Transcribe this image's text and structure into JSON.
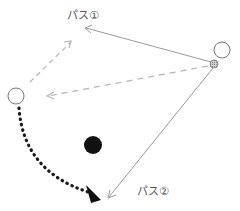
{
  "diagram": {
    "title": "",
    "labels": {
      "pass1": "パス①",
      "pass2": "パス②"
    },
    "nodes": [
      {
        "id": "player-right",
        "type": "open-circle",
        "cx": 222,
        "cy": 50,
        "r": 8
      },
      {
        "id": "ball",
        "type": "shaded-circle",
        "cx": 214,
        "cy": 64,
        "r": 4
      },
      {
        "id": "player-left",
        "type": "open-circle",
        "cx": 16,
        "cy": 96,
        "r": 8
      },
      {
        "id": "defender",
        "type": "solid-circle",
        "cx": 93,
        "cy": 145,
        "r": 9
      }
    ],
    "edges": [
      {
        "id": "pass1-line",
        "from": "ball",
        "to": [
          85,
          28
        ],
        "style": "solid",
        "meaning": "pass ①"
      },
      {
        "id": "pass2-line",
        "from": "ball",
        "to": [
          108,
          198
        ],
        "style": "solid",
        "meaning": "pass ②"
      },
      {
        "id": "fake-pass-line",
        "from": "ball",
        "to": [
          47,
          96
        ],
        "style": "dashed"
      },
      {
        "id": "left-run-line",
        "from": "player-left",
        "to": [
          72,
          41
        ],
        "style": "dashed"
      },
      {
        "id": "dribble-run",
        "from": "player-left",
        "to": [
          100,
          200
        ],
        "style": "dotted-curve"
      }
    ],
    "colors": {
      "line": "#9a9a9a",
      "dashed": "#b5b5b5",
      "circle_stroke": "#777777",
      "ball_fill": "#bdbdbd",
      "defender": "#111111",
      "dotted": "#1a1a1a",
      "text": "#555555"
    }
  }
}
